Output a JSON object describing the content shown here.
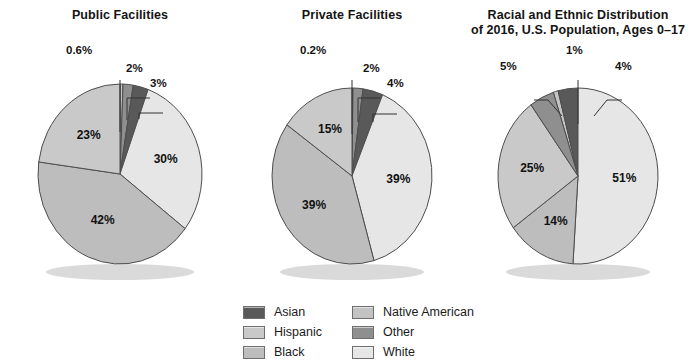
{
  "chart_data": [
    {
      "type": "pie",
      "title": "Public Facilities",
      "title_line2": "",
      "categories": [
        "Native American",
        "Other",
        "Asian",
        "White",
        "Black",
        "Hispanic"
      ],
      "values": [
        0.6,
        2,
        3,
        30,
        42,
        23
      ],
      "labels": [
        "0.6%",
        "2%",
        "3%",
        "30%",
        "42%",
        "23%"
      ],
      "callouts": [
        "0.6%",
        "2%",
        "3%"
      ],
      "inside_labels": [
        "30%",
        "42%",
        "23%"
      ],
      "xlabel": "",
      "ylabel": "",
      "legend_position": "bottom-center"
    },
    {
      "type": "pie",
      "title": "Private Facilities",
      "title_line2": "",
      "categories": [
        "Native American",
        "Other",
        "Asian",
        "White",
        "Black",
        "Hispanic"
      ],
      "values": [
        0.2,
        2,
        4,
        39,
        39,
        15
      ],
      "labels": [
        "0.2%",
        "2%",
        "4%",
        "39%",
        "39%",
        "15%"
      ],
      "callouts": [
        "0.2%",
        "2%",
        "4%"
      ],
      "inside_labels": [
        "39%",
        "39%",
        "15%"
      ],
      "xlabel": "",
      "ylabel": "",
      "legend_position": "bottom-center"
    },
    {
      "type": "pie",
      "title": "Racial and Ethnic Distribution",
      "title_line2": "of 2016, U.S. Population, Ages  0–17",
      "categories": [
        "Native American",
        "Asian",
        "White",
        "Black",
        "Hispanic",
        "Other"
      ],
      "values": [
        1,
        4,
        51,
        14,
        25,
        5
      ],
      "labels": [
        "1%",
        "4%",
        "51%",
        "14%",
        "25%",
        "5%"
      ],
      "callouts": [
        "5%",
        "1%",
        "4%"
      ],
      "inside_labels": [
        "51%",
        "14%",
        "25%"
      ],
      "xlabel": "",
      "ylabel": "",
      "legend_position": "bottom-center"
    }
  ],
  "legend": {
    "items": [
      {
        "label": "Asian",
        "color": "#595959"
      },
      {
        "label": "Native American",
        "color": "#c3c3c3"
      },
      {
        "label": "Hispanic",
        "color": "#c9c9c9"
      },
      {
        "label": "Other",
        "color": "#8f8f8f"
      },
      {
        "label": "Black",
        "color": "#bdbdbd"
      },
      {
        "label": "White",
        "color": "#e6e6e6"
      }
    ]
  },
  "colors": {
    "asian": "#595959",
    "native_american": "#c3c3c3",
    "hispanic": "#c9c9c9",
    "other": "#8f8f8f",
    "black": "#bdbdbd",
    "white": "#e6e6e6",
    "stroke": "#4d4d4d",
    "text": "#141414"
  }
}
